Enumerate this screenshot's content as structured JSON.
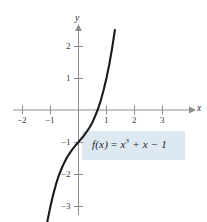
{
  "chart_data": {
    "type": "line",
    "title": "",
    "subtitle": "",
    "xlabel": "x",
    "ylabel": "y",
    "function_expression": "f(x) = x^3 + x - 1",
    "xlim": [
      -2.6,
      3.6
    ],
    "ylim": [
      -3.6,
      2.6
    ],
    "x_ticks": [
      -2,
      -1,
      1,
      2,
      3
    ],
    "x_tick_labels": [
      "−2",
      "−1",
      "1",
      "2",
      "3"
    ],
    "y_ticks": [
      2,
      1,
      -1,
      -2,
      -3
    ],
    "y_tick_labels": [
      "2",
      "1",
      "−1",
      "−2",
      "−3"
    ],
    "grid": false,
    "legend_position": "none",
    "axis_arrows": [
      "x-positive",
      "y-positive"
    ],
    "series": [
      {
        "name": "f(x) = x^3 + x - 1",
        "x": [
          -1.28,
          -1.2,
          -1.1,
          -1.0,
          -0.9,
          -0.8,
          -0.7,
          -0.6,
          -0.5,
          -0.4,
          -0.3,
          -0.2,
          -0.1,
          0.0,
          0.1,
          0.2,
          0.3,
          0.4,
          0.5,
          0.6,
          0.682,
          0.7,
          0.8,
          0.9,
          1.0,
          1.1,
          1.2,
          1.3
        ],
        "y": [
          -4.38,
          -3.93,
          -3.43,
          -3.0,
          -2.63,
          -2.31,
          -2.04,
          -1.82,
          -1.63,
          -1.46,
          -1.33,
          -1.21,
          -1.1,
          -1.0,
          -0.9,
          -0.79,
          -0.67,
          -0.54,
          -0.38,
          -0.18,
          0.0,
          0.04,
          0.31,
          0.63,
          1.0,
          1.43,
          1.93,
          2.5
        ]
      }
    ],
    "annotations": [
      {
        "name": "function-label",
        "text": "f(x) = x³ + x − 1",
        "highlight_color": "#dde8f1",
        "at_x": 0.5,
        "at_y": -1.35
      }
    ],
    "colors": {
      "curve": "#1a1a1a",
      "axis": "#8c8c8c",
      "tick_text": "#3a3a3a",
      "highlight": "#dde8f1",
      "background": "#ffffff"
    }
  },
  "figure": {
    "axis_label_x": "x",
    "axis_label_y": "y",
    "label_parts": {
      "fx": "f(x)",
      "equals": " = ",
      "x_base": "x",
      "exponent": "3",
      "plus_x": " + x",
      "minus_one": " − 1"
    }
  }
}
